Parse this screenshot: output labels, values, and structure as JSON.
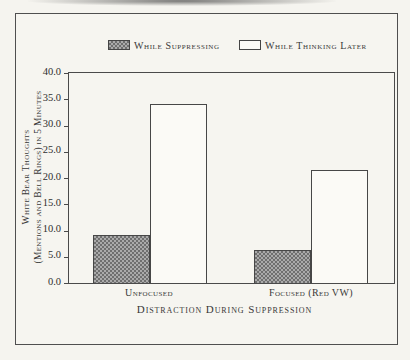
{
  "figure": {
    "background_color": "#f5f4ef",
    "frame_border_color": "#4f4f4f",
    "hatch_dark_color": "#6f6f6f",
    "hatch_light_color": "#aaaaaa"
  },
  "chart_data": {
    "type": "bar",
    "title": "",
    "categories": [
      "Unfocused",
      "Focused (Red VW)"
    ],
    "series": [
      {
        "name": "While Suppressing",
        "values": [
          9.2,
          6.2
        ],
        "fill": "hatched-gray"
      },
      {
        "name": "While Thinking Later",
        "values": [
          34.0,
          21.5
        ],
        "fill": "white"
      }
    ],
    "xlabel": "Distraction During Suppression",
    "ylabel_line1": "White Bear Thoughts",
    "ylabel_line2": "(Mentions and Bell Rings) in 5 Minutes",
    "ylim": [
      0,
      40
    ],
    "ytick_labels": [
      "40.0",
      "35.0",
      "30.0",
      "25.0",
      "20.0",
      "15.0",
      "10.0",
      "5.0",
      "0.0"
    ],
    "legend_position": "top",
    "grid": false
  }
}
